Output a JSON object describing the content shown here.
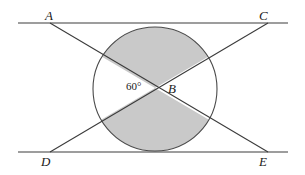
{
  "figure": {
    "background_color": "#ffffff",
    "line_color": "#3c3c3c",
    "circle_stroke_color": "#4a4a4a",
    "shaded_sector_fill": "#c9c9c9",
    "unshaded_sector_fill": "#ffffff"
  },
  "labels": {
    "A": "A",
    "B": "B",
    "C": "C",
    "D": "D",
    "E": "E",
    "angle": "60°"
  },
  "geometry": {
    "top_line": {
      "name": "line-AC",
      "x1": 18,
      "y1": 23,
      "x2": 288,
      "y2": 23
    },
    "bottom_line": {
      "name": "line-DE",
      "x1": 18,
      "y1": 152,
      "x2": 288,
      "y2": 152
    },
    "diagonal_A_to_E": {
      "name": "segment-AE",
      "x1": 50,
      "y1": 23,
      "x2": 268,
      "y2": 152
    },
    "diagonal_D_to_C": {
      "name": "segment-DC",
      "x1": 50,
      "y1": 152,
      "x2": 268,
      "y2": 23
    },
    "circle": {
      "cx": 155,
      "cy": 89,
      "r": 62
    },
    "intersection_point": {
      "name": "point-B",
      "x": 155,
      "y": 88
    },
    "angle_value_degrees": 60,
    "shaded_sectors": [
      "top",
      "bottom"
    ],
    "unshaded_sectors": [
      "left",
      "right"
    ]
  }
}
